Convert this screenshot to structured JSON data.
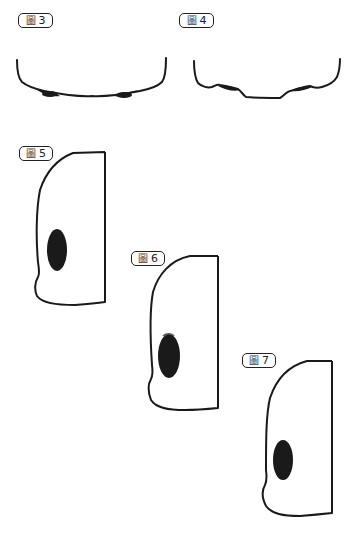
{
  "figures": [
    {
      "id": "fig3",
      "prefix": "圖",
      "number": "3",
      "label": "圖 3"
    },
    {
      "id": "fig4",
      "prefix": "圖",
      "number": "4",
      "label": "圖 4"
    },
    {
      "id": "fig5",
      "prefix": "圖",
      "number": "5",
      "label": "圖 5"
    },
    {
      "id": "fig6",
      "prefix": "圖",
      "number": "6",
      "label": "圖 6"
    },
    {
      "id": "fig7",
      "prefix": "圖",
      "number": "7",
      "label": "圖 7"
    }
  ],
  "colors": {
    "stroke": "#1a1a1a",
    "fill": "#1a1a1a",
    "background": "#ffffff"
  }
}
